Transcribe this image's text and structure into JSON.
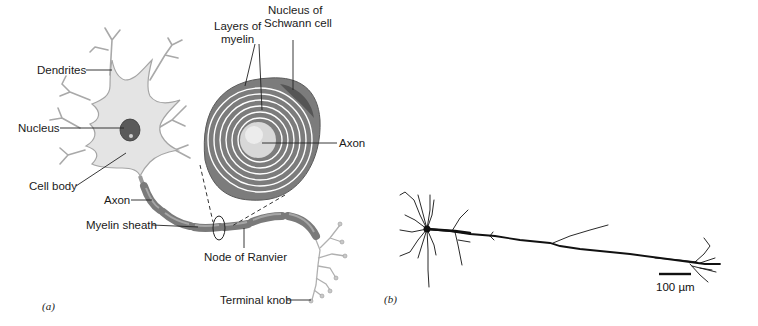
{
  "figure": {
    "panel_a": {
      "label": "(a)",
      "labels": {
        "dendrites": "Dendrites",
        "nucleus": "Nucleus",
        "cell_body": "Cell body",
        "axon": "Axon",
        "myelin_sheath": "Myelin sheath",
        "layers_of_myelin_1": "Layers of",
        "layers_of_myelin_2": "myelin",
        "nucleus_schwann_1": "Nucleus of",
        "nucleus_schwann_2": "Schwann cell",
        "axon_cross": "Axon",
        "node_of_ranvier": "Node of Ranvier",
        "terminal_knob": "Terminal knob"
      }
    },
    "panel_b": {
      "label": "(b)",
      "scale_bar": "100 µm"
    }
  },
  "colors": {
    "cell_fill": "#e2e2e2",
    "cell_stroke": "#9a9a9a",
    "myelin_dark": "#7c7c7c",
    "myelin_light": "#a8a8a8",
    "nucleus": "#555555",
    "ink": "#1a1a1a"
  }
}
